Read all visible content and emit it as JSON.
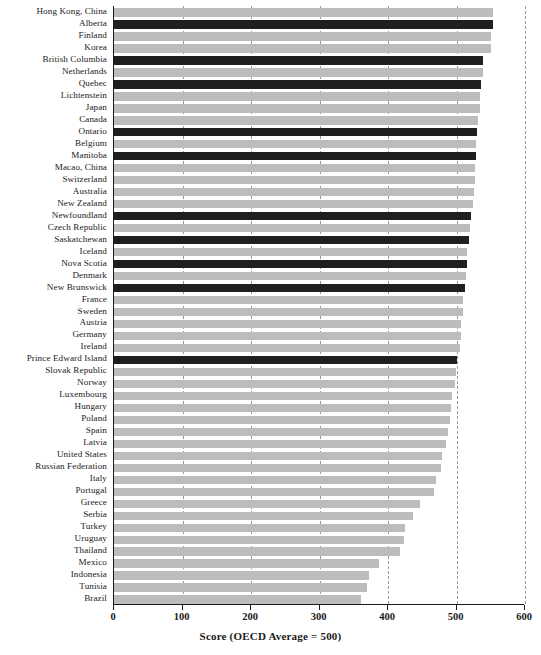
{
  "chart_data": {
    "type": "bar",
    "orientation": "horizontal",
    "title": "",
    "subtitle": "",
    "xlabel": "Score (OECD Average = 500)",
    "ylabel": "",
    "xlim": [
      0,
      600
    ],
    "xticks": [
      0,
      100,
      200,
      300,
      400,
      500,
      600
    ],
    "xtick_labels": [
      "0",
      "100",
      "200",
      "300",
      "400",
      "500",
      "600"
    ],
    "grid": true,
    "grid_axis": "x",
    "grid_style": "dashed",
    "legend": "none",
    "colors": {
      "bar_default": "#bcbcbc",
      "bar_highlight": "#1f1f1f",
      "axis": "#1a1a1a",
      "gridline": "#9a9a9a",
      "background": "#ffffff"
    },
    "highlight_meaning": "Canadian provinces shown in dark",
    "categories": [
      "Hong Kong, China",
      "Alberta",
      "Finland",
      "Korea",
      "British Columbia",
      "Netherlands",
      "Quebec",
      "Lichtenstein",
      "Japan",
      "Canada",
      "Ontario",
      "Belgium",
      "Manitoba",
      "Macao, China",
      "Switzerland",
      "Australia",
      "New Zealand",
      "Newfoundland",
      "Czech Republic",
      "Saskatchewan",
      "Iceland",
      "Nova Scotia",
      "Denmark",
      "New Brunswick",
      "France",
      "Sweden",
      "Austria",
      "Germany",
      "Ireland",
      "Prince Edward Island",
      "Slovak Republic",
      "Norway",
      "Luxembourg",
      "Hungary",
      "Poland",
      "Spain",
      "Latvia",
      "United States",
      "Russian Federation",
      "Italy",
      "Portugal",
      "Greece",
      "Serbia",
      "Turkey",
      "Uruguay",
      "Thailand",
      "Mexico",
      "Indonesia",
      "Tunisia",
      "Brazil"
    ],
    "values": [
      553,
      553,
      550,
      550,
      538,
      538,
      536,
      535,
      534,
      532,
      530,
      529,
      528,
      527,
      527,
      525,
      524,
      521,
      520,
      518,
      516,
      515,
      514,
      512,
      510,
      509,
      507,
      506,
      505,
      501,
      499,
      498,
      494,
      492,
      491,
      487,
      485,
      479,
      478,
      470,
      467,
      447,
      437,
      425,
      423,
      418,
      387,
      372,
      370,
      360
    ],
    "highlight_flags": [
      false,
      true,
      false,
      false,
      true,
      false,
      true,
      false,
      false,
      false,
      true,
      false,
      true,
      false,
      false,
      false,
      false,
      true,
      false,
      true,
      false,
      true,
      false,
      true,
      false,
      false,
      false,
      false,
      false,
      true,
      false,
      false,
      false,
      false,
      false,
      false,
      false,
      false,
      false,
      false,
      false,
      false,
      false,
      false,
      false,
      false,
      false,
      false,
      false,
      false
    ]
  }
}
